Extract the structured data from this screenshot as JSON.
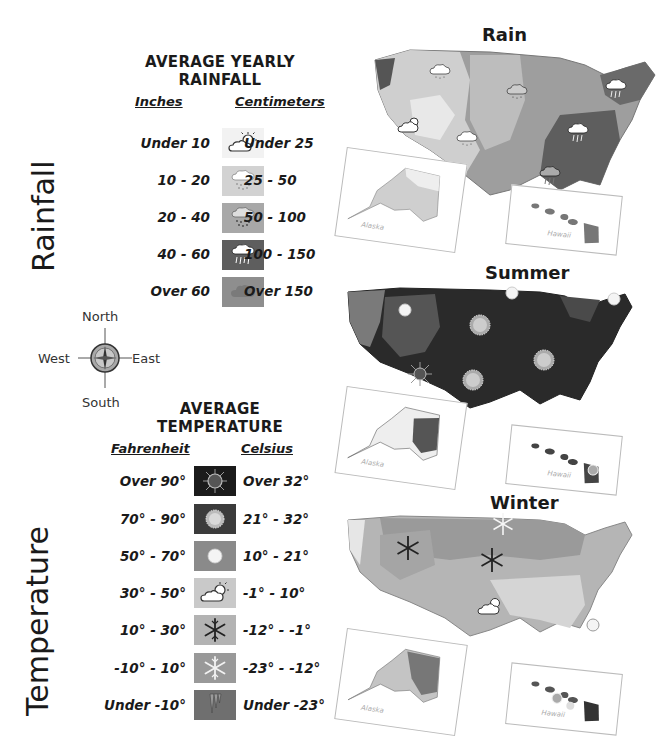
{
  "rainfall_legend": {
    "side_title": "Rainfall",
    "title_line1": "AVERAGE YEARLY",
    "title_line2": "RAINFALL",
    "col_left": "Inches",
    "col_right": "Centimeters",
    "rows": [
      {
        "inches": "Under 10",
        "cm": "Under 25",
        "icon": "sun-cloud-icon",
        "color": "#f2f2f2"
      },
      {
        "inches": "10 - 20",
        "cm": "25 - 50",
        "icon": "light-rain-cloud-icon",
        "color": "#cfcfcf"
      },
      {
        "inches": "20 - 40",
        "cm": "50 - 100",
        "icon": "rain-cloud-icon",
        "color": "#a9a9a9"
      },
      {
        "inches": "40 - 60",
        "cm": "100 - 150",
        "icon": "heavy-rain-cloud-icon",
        "color": "#6a6a6a"
      },
      {
        "inches": "Over 60",
        "cm": "Over 150",
        "icon": "dark-cloud-icon",
        "color": "#8c8c8c"
      }
    ]
  },
  "compass": {
    "north": "North",
    "south": "South",
    "east": "East",
    "west": "West"
  },
  "temperature_legend": {
    "side_title": "Temperature",
    "title_line1": "AVERAGE",
    "title_line2": "TEMPERATURE",
    "col_left": "Fahrenheit",
    "col_right": "Celsius",
    "rows": [
      {
        "f": "Over 90°",
        "c": "Over 32°",
        "icon": "blazing-sun-icon",
        "color": "#1e1e1e"
      },
      {
        "f": "70° - 90°",
        "c": "21° - 32°",
        "icon": "sun-icon",
        "color": "#3f3f3f"
      },
      {
        "f": "50° - 70°",
        "c": "10° - 21°",
        "icon": "mild-sun-icon",
        "color": "#8a8a8a"
      },
      {
        "f": "30° - 50°",
        "c": "-1° - 10°",
        "icon": "sun-cloud-icon",
        "color": "#c9c9c9"
      },
      {
        "f": "10° - 30°",
        "c": "-12° - -1°",
        "icon": "snowflake-icon",
        "color": "#b0b0b0"
      },
      {
        "f": "-10° - 10°",
        "c": "-23° - -12°",
        "icon": "light-snowflake-icon",
        "color": "#9a9a9a"
      },
      {
        "f": "Under -10°",
        "c": "Under -23°",
        "icon": "icicle-icon",
        "color": "#6e6e6e"
      }
    ]
  },
  "maps": {
    "rain": {
      "title": "Rain",
      "inset_alaska": "Alaska",
      "inset_hawaii": "Hawaii"
    },
    "summer": {
      "title": "Summer",
      "inset_alaska": "Alaska",
      "inset_hawaii": "Hawaii"
    },
    "winter": {
      "title": "Winter",
      "inset_alaska": "Alaska",
      "inset_hawaii": "Hawaii"
    }
  }
}
